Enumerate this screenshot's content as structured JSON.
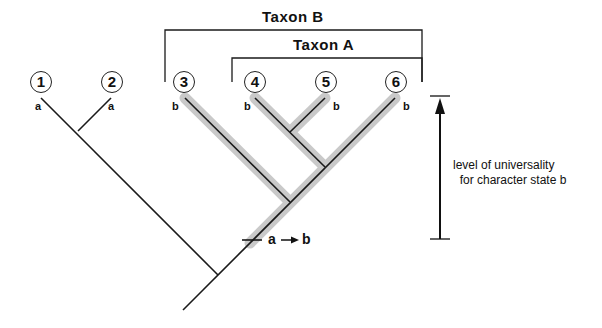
{
  "diagram": {
    "type": "cladogram",
    "taxa": [
      {
        "id": "1",
        "state": "a"
      },
      {
        "id": "2",
        "state": "a"
      },
      {
        "id": "3",
        "state": "b"
      },
      {
        "id": "4",
        "state": "b"
      },
      {
        "id": "5",
        "state": "b"
      },
      {
        "id": "6",
        "state": "b"
      }
    ],
    "groups": [
      {
        "label": "Taxon B",
        "members": [
          "3",
          "4",
          "5",
          "6"
        ]
      },
      {
        "label": "Taxon A",
        "members": [
          "4",
          "5",
          "6"
        ]
      }
    ],
    "transition": {
      "from": "a",
      "to": "b",
      "label_from": "a",
      "label_to": "b"
    },
    "caption": {
      "line1": "level of universality",
      "line2": "  for character state b"
    },
    "colors": {
      "line": "#1a1a1a",
      "highlight": "#bdbdbd"
    }
  }
}
